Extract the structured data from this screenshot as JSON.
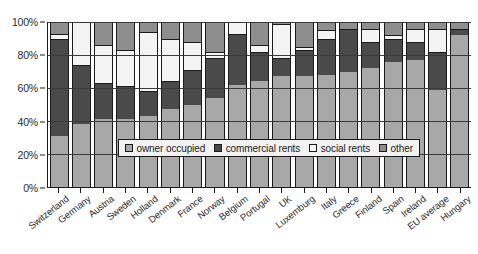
{
  "chart_data": {
    "type": "bar",
    "stacked": true,
    "stack_mode": "percent",
    "title": "",
    "xlabel": "",
    "ylabel": "",
    "ylim": [
      0,
      100
    ],
    "ytick_labels": [
      "0%",
      "20%",
      "40%",
      "60%",
      "80%",
      "100%"
    ],
    "ytick_values": [
      0,
      20,
      40,
      60,
      80,
      100
    ],
    "grid": true,
    "legend_position": "inside-center",
    "categories": [
      "Switzerland",
      "Germany",
      "Austria",
      "Sweden",
      "Holland",
      "Denmark",
      "France",
      "Norway",
      "Belgium",
      "Portugal",
      "UK",
      "Luxemburg",
      "Italy",
      "Greece",
      "Finland",
      "Spain",
      "Ireland",
      "EU average",
      "Hungary"
    ],
    "series": [
      {
        "name": "owner occupied",
        "color": "#a8a8a8",
        "values": [
          31,
          38,
          41,
          41,
          43,
          47,
          50,
          54,
          62,
          64,
          67,
          67,
          68,
          70,
          72,
          76,
          77,
          59,
          92
        ]
      },
      {
        "name": "commercial rents",
        "color": "#4a4a4a",
        "values": [
          59,
          36,
          22,
          20,
          15,
          17,
          21,
          24,
          31,
          18,
          11,
          16,
          22,
          26,
          16,
          14,
          11,
          23,
          4
        ]
      },
      {
        "name": "social rents",
        "color": "#f4f4f4",
        "values": [
          3,
          26,
          23,
          22,
          36,
          26,
          17,
          4,
          7,
          4,
          21,
          2,
          5,
          0,
          8,
          2,
          8,
          14,
          0
        ]
      },
      {
        "name": "other",
        "color": "#8e8e8e",
        "values": [
          7,
          0,
          14,
          17,
          6,
          10,
          12,
          18,
          0,
          14,
          1,
          15,
          5,
          4,
          4,
          8,
          4,
          4,
          4
        ]
      }
    ]
  },
  "legend": {
    "items": [
      {
        "label": "owner occupied",
        "swatch": "owner"
      },
      {
        "label": "commercial rents",
        "swatch": "commercial"
      },
      {
        "label": "social rents",
        "swatch": "social"
      },
      {
        "label": "other",
        "swatch": "other"
      }
    ]
  },
  "colors": {
    "owner_occupied": "#a8a8a8",
    "commercial_rents": "#4a4a4a",
    "social_rents": "#f4f4f4",
    "other": "#8e8e8e",
    "axis": "#1a1a1a",
    "grid": "#3a3a3a",
    "background": "#ffffff"
  }
}
